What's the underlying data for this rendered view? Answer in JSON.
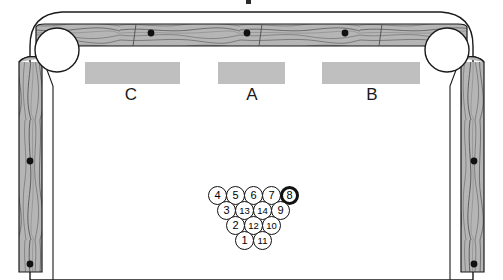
{
  "diagram": {
    "surface_color": "#ffffff",
    "rail_color": "#b3b3b3",
    "rail_outline_color": "#1a1a1a",
    "zone_color": "#bfbfbf",
    "ball_outline_color": "#111111"
  },
  "zones": [
    {
      "label": "C",
      "x": 85,
      "y": 62,
      "width": 95,
      "height": 22,
      "label_x": 111,
      "label_y": 85
    },
    {
      "label": "A",
      "x": 218,
      "y": 62,
      "width": 67,
      "height": 22,
      "label_x": 232,
      "label_y": 85
    },
    {
      "label": "B",
      "x": 322,
      "y": 62,
      "width": 98,
      "height": 22,
      "label_x": 352,
      "label_y": 85
    }
  ],
  "top_rail_spots": [
    {
      "cx": 151,
      "cy": 33,
      "r": 3.4
    },
    {
      "cx": 247,
      "cy": 33,
      "r": 3.4
    },
    {
      "cx": 345,
      "cy": 33,
      "r": 3.4
    }
  ],
  "left_rail_spots": [
    {
      "cx": 30,
      "cy": 161,
      "r": 3.4
    },
    {
      "cx": 30,
      "cy": 264,
      "r": 3.4
    }
  ],
  "right_rail_spots": [
    {
      "cx": 474,
      "cy": 161,
      "r": 3.4
    },
    {
      "cx": 474,
      "cy": 264,
      "r": 3.4
    }
  ],
  "pockets": [
    {
      "name": "top-left-pocket",
      "cx": 57,
      "cy": 50,
      "r": 22
    },
    {
      "name": "top-right-pocket",
      "cx": 447,
      "cy": 50,
      "r": 22
    }
  ],
  "rack": {
    "ball_diameter": 19,
    "rows": [
      {
        "row": 1,
        "y": 186,
        "balls": [
          {
            "number": "4",
            "x": 208,
            "highlight": false
          },
          {
            "number": "5",
            "x": 226,
            "highlight": false
          },
          {
            "number": "6",
            "x": 244,
            "highlight": false
          },
          {
            "number": "7",
            "x": 262,
            "highlight": false
          },
          {
            "number": "8",
            "x": 280,
            "highlight": true
          }
        ]
      },
      {
        "row": 2,
        "y": 201,
        "balls": [
          {
            "number": "3",
            "x": 217,
            "highlight": false
          },
          {
            "number": "13",
            "x": 235,
            "highlight": false
          },
          {
            "number": "14",
            "x": 253,
            "highlight": false
          },
          {
            "number": "9",
            "x": 271,
            "highlight": false
          }
        ]
      },
      {
        "row": 3,
        "y": 216,
        "balls": [
          {
            "number": "2",
            "x": 226,
            "highlight": false
          },
          {
            "number": "12",
            "x": 244,
            "highlight": false
          },
          {
            "number": "10",
            "x": 262,
            "highlight": false
          }
        ]
      },
      {
        "row": 4,
        "y": 231,
        "balls": [
          {
            "number": "1",
            "x": 235,
            "highlight": false
          },
          {
            "number": "11",
            "x": 253,
            "highlight": false
          }
        ]
      }
    ]
  }
}
